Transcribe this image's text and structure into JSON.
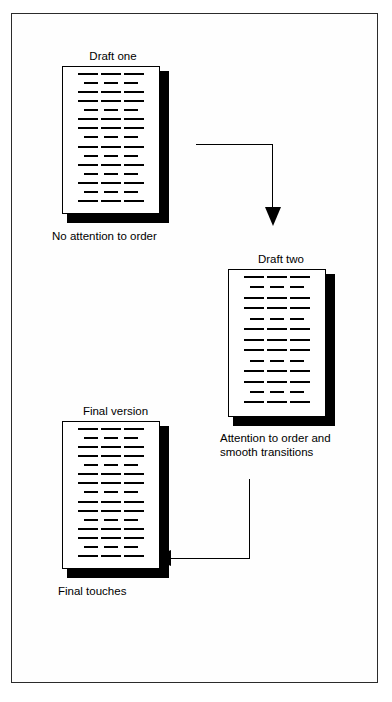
{
  "figure": {
    "type": "process-flow-diagram",
    "border_color": "#2b2b2b",
    "ink_color": "#000000",
    "background": "#ffffff"
  },
  "nodes": [
    {
      "id": "draft-one",
      "title": "Draft one",
      "caption": "No attention to order",
      "line_rows": 15,
      "row_pattern": [
        "wide",
        "narrow",
        "wide",
        "wide",
        "narrow",
        "wide",
        "wide",
        "narrow",
        "wide",
        "narrow",
        "wide",
        "narrow",
        "wide",
        "narrow",
        "wide"
      ]
    },
    {
      "id": "draft-two",
      "title": "Draft two",
      "caption": "Attention to order and\nsmooth transitions",
      "line_rows": 13,
      "row_pattern": [
        "wide",
        "narrow",
        "wide",
        "wide",
        "narrow",
        "wide",
        "wide",
        "wide",
        "narrow",
        "wide",
        "wide",
        "narrow",
        "wide"
      ]
    },
    {
      "id": "final-version",
      "title": "Final version",
      "caption": "Final touches",
      "line_rows": 15,
      "row_pattern": [
        "wide",
        "narrow",
        "wide",
        "wide",
        "narrow",
        "wide",
        "wide",
        "narrow",
        "wide",
        "wide",
        "narrow",
        "wide",
        "wide",
        "narrow",
        "wide"
      ]
    }
  ],
  "connectors": [
    {
      "id": "draft-one-to-draft-two",
      "from": "draft-one",
      "to": "draft-two",
      "direction": "right-then-down",
      "arrowhead": "down"
    },
    {
      "id": "draft-two-to-final-version",
      "from": "draft-two",
      "to": "final-version",
      "direction": "down-then-left",
      "arrowhead": "left"
    }
  ]
}
